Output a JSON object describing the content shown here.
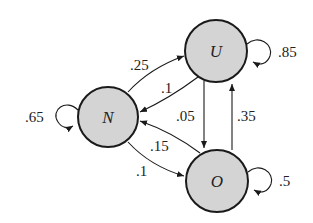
{
  "diagram": {
    "type": "state-transition",
    "nodes": [
      {
        "id": "N",
        "label": "N",
        "cx": 108,
        "cy": 117,
        "r": 30
      },
      {
        "id": "U",
        "label": "U",
        "cx": 216,
        "cy": 51,
        "r": 31
      },
      {
        "id": "O",
        "label": "O",
        "cx": 217,
        "cy": 181,
        "r": 31
      }
    ],
    "edges": [
      {
        "from": "N",
        "to": "U",
        "label": ".25"
      },
      {
        "from": "U",
        "to": "N",
        "label": ".1"
      },
      {
        "from": "U",
        "to": "O",
        "label": ".05"
      },
      {
        "from": "O",
        "to": "U",
        "label": ".35"
      },
      {
        "from": "O",
        "to": "N",
        "label": ".15"
      },
      {
        "from": "N",
        "to": "O",
        "label": ".1"
      },
      {
        "from": "N",
        "to": "N",
        "label": ".65"
      },
      {
        "from": "U",
        "to": "U",
        "label": ".85"
      },
      {
        "from": "O",
        "to": "O",
        "label": ".5"
      }
    ],
    "colors": {
      "node_fill": "#d4d4d4",
      "stroke": "#1a1a1a"
    }
  }
}
